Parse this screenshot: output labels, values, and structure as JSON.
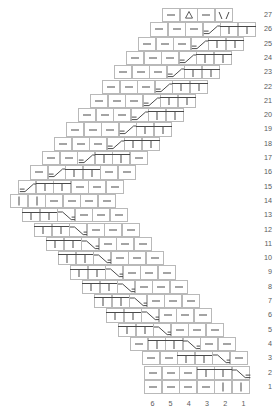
{
  "chart_data": {
    "type": "table",
    "xlabel": "stitch column",
    "ylabel": "row",
    "grid": true,
    "legend_position": "none",
    "row_numbers": [
      27,
      26,
      25,
      24,
      23,
      22,
      21,
      20,
      19,
      18,
      17,
      16,
      15,
      14,
      13,
      12,
      11,
      10,
      9,
      8,
      7,
      6,
      5,
      4,
      3,
      2,
      1
    ],
    "column_numbers": [
      6,
      5,
      4,
      3,
      2,
      1
    ],
    "symbol_key": {
      "dash": "purl stitch",
      "bar": "knit stitch",
      "barline": "knit stitch under bridge",
      "rampup": "left-leaning ramp / raised increase",
      "rampdn": "right-leaning ramp / raised decrease",
      "yo": "yarn over",
      "cdd": "centered double decrease"
    },
    "colors": {
      "grid": "#b9b9b9",
      "symbol": "#4a4a4a",
      "label": "#5a5a5a",
      "background": "#ffffff"
    },
    "rows": [
      {
        "num": 27,
        "left": 162.0,
        "cells": [
          "dash",
          "yo",
          "dash",
          "cdd"
        ]
      },
      {
        "num": 26,
        "left": 150.0,
        "cells": [
          "dash",
          "dash",
          "dash",
          "rampup",
          "barline",
          "barline"
        ]
      },
      {
        "num": 25,
        "left": 138.0,
        "cells": [
          "dash",
          "dash",
          "dash",
          "rampup",
          "barline",
          "barline"
        ]
      },
      {
        "num": 24,
        "left": 126.0,
        "cells": [
          "dash",
          "dash",
          "dash",
          "rampup",
          "barline",
          "barline"
        ]
      },
      {
        "num": 23,
        "left": 114.0,
        "cells": [
          "dash",
          "dash",
          "dash",
          "rampup",
          "barline",
          "barline"
        ]
      },
      {
        "num": 22,
        "left": 102.0,
        "cells": [
          "dash",
          "dash",
          "dash",
          "rampup",
          "barline",
          "barline"
        ]
      },
      {
        "num": 21,
        "left": 90.0,
        "cells": [
          "dash",
          "dash",
          "dash",
          "rampup",
          "barline",
          "barline"
        ]
      },
      {
        "num": 20,
        "left": 78.0,
        "cells": [
          "dash",
          "dash",
          "dash",
          "rampup",
          "barline",
          "barline"
        ]
      },
      {
        "num": 19,
        "left": 66.0,
        "cells": [
          "dash",
          "dash",
          "dash",
          "rampup",
          "barline",
          "barline"
        ]
      },
      {
        "num": 18,
        "left": 54.0,
        "cells": [
          "dash",
          "dash",
          "dash",
          "rampup",
          "barline",
          "barline"
        ]
      },
      {
        "num": 17,
        "left": 42.0,
        "cells": [
          "dash",
          "dash",
          "rampup",
          "barline",
          "barline",
          "dash"
        ]
      },
      {
        "num": 16,
        "left": 30.0,
        "cells": [
          "dash",
          "rampup",
          "barline",
          "barline",
          "dash",
          "dash"
        ]
      },
      {
        "num": 15,
        "left": 18.0,
        "cells": [
          "rampup",
          "barline",
          "barline",
          "dash",
          "dash",
          "dash"
        ]
      },
      {
        "num": 14,
        "left": 10.0,
        "cells": [
          "bar",
          "bar",
          "dash",
          "dash",
          "dash",
          "dash"
        ]
      },
      {
        "num": 13,
        "left": 22.0,
        "cells": [
          "barline",
          "barline",
          "rampdn",
          "dash",
          "dash",
          "dash"
        ]
      },
      {
        "num": 12,
        "left": 34.0,
        "cells": [
          "barline",
          "barline",
          "rampdn",
          "dash",
          "dash",
          "dash"
        ]
      },
      {
        "num": 11,
        "left": 46.0,
        "cells": [
          "barline",
          "barline",
          "rampdn",
          "dash",
          "dash",
          "dash"
        ]
      },
      {
        "num": 10,
        "left": 58.0,
        "cells": [
          "barline",
          "barline",
          "rampdn",
          "dash",
          "dash",
          "dash"
        ]
      },
      {
        "num": 9,
        "left": 70.0,
        "cells": [
          "barline",
          "barline",
          "rampdn",
          "dash",
          "dash",
          "dash"
        ]
      },
      {
        "num": 8,
        "left": 82.0,
        "cells": [
          "barline",
          "barline",
          "rampdn",
          "dash",
          "dash",
          "dash"
        ]
      },
      {
        "num": 7,
        "left": 94.0,
        "cells": [
          "barline",
          "barline",
          "rampdn",
          "dash",
          "dash",
          "dash"
        ]
      },
      {
        "num": 6,
        "left": 106.0,
        "cells": [
          "barline",
          "barline",
          "rampdn",
          "dash",
          "dash",
          "dash"
        ]
      },
      {
        "num": 5,
        "left": 118.0,
        "cells": [
          "barline",
          "barline",
          "rampdn",
          "dash",
          "dash",
          "dash"
        ]
      },
      {
        "num": 4,
        "left": 130.0,
        "cells": [
          "dash",
          "barline",
          "barline",
          "rampdn",
          "dash",
          "dash"
        ]
      },
      {
        "num": 3,
        "left": 142.0,
        "cells": [
          "dash",
          "dash",
          "barline",
          "barline",
          "rampdn",
          "dash"
        ]
      },
      {
        "num": 2,
        "left": 144.0,
        "cells": [
          "dash",
          "dash",
          "dash",
          "barline",
          "barline",
          "rampdn"
        ]
      },
      {
        "num": 1,
        "left": 144.0,
        "cells": [
          "dash",
          "dash",
          "dash",
          "dash",
          "bar",
          "bar"
        ]
      }
    ]
  }
}
